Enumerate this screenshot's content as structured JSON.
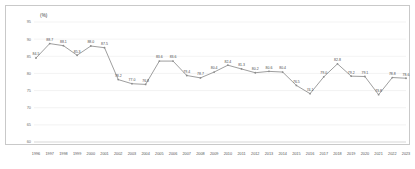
{
  "unit_label": "(%)",
  "chart_data": {
    "type": "line",
    "title": "",
    "xlabel": "",
    "ylabel": "",
    "unit": "(%)",
    "ylim": [
      60,
      95
    ],
    "yticks": [
      60,
      65,
      70,
      75,
      80,
      85,
      90,
      95
    ],
    "grid": true,
    "legend": "none",
    "show_point_labels": true,
    "categories": [
      "1996",
      "1997",
      "1998",
      "1999",
      "2000",
      "2001",
      "2002",
      "2003",
      "2004",
      "2005",
      "2006",
      "2007",
      "2008",
      "2009",
      "2010",
      "2011",
      "2012",
      "2013",
      "2014",
      "2015",
      "2016",
      "2017",
      "2018",
      "2019",
      "2020",
      "2021",
      "2022",
      "2023"
    ],
    "values": [
      84.5,
      88.7,
      88.1,
      85.3,
      88.0,
      87.5,
      78.2,
      77.0,
      76.8,
      83.6,
      83.6,
      79.4,
      78.7,
      80.4,
      82.4,
      81.3,
      80.2,
      80.6,
      80.4,
      76.5,
      74.1,
      79.0,
      82.8,
      79.2,
      79.1,
      73.8,
      78.8,
      78.6
    ],
    "point_labels": [
      "84.5",
      "88.7",
      "88.1",
      "85.3",
      "88.0",
      "87.5",
      "78.2",
      "77.0",
      "76.8",
      "83.6",
      "83.6",
      "79.4",
      "78.7",
      "80.4",
      "82.4",
      "81.3",
      "80.2",
      "80.6",
      "80.4",
      "76.5",
      "74.1",
      "79.0",
      "82.8",
      "79.2",
      "79.1",
      "73.8",
      "78.8",
      "78.6"
    ]
  }
}
